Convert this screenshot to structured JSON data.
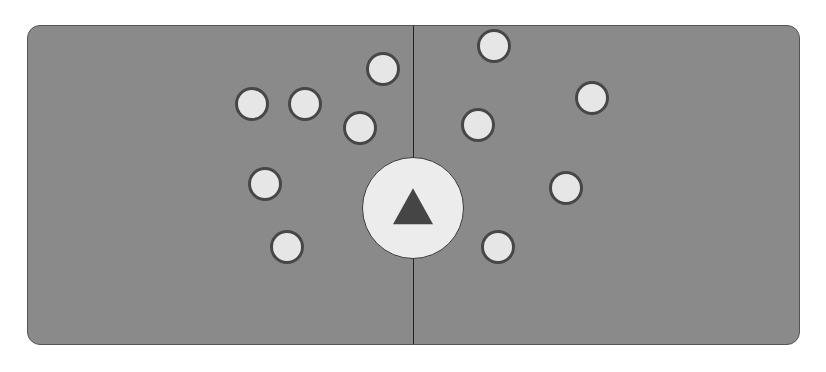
{
  "board": {
    "background_color": "#8a8a8a",
    "divider_color": "#222222",
    "left_side": {
      "dots": [
        {
          "x": 252,
          "y": 104
        },
        {
          "x": 305,
          "y": 104
        },
        {
          "x": 383,
          "y": 69
        },
        {
          "x": 360,
          "y": 128
        },
        {
          "x": 265,
          "y": 184
        },
        {
          "x": 287,
          "y": 247
        }
      ]
    },
    "right_side": {
      "dots": [
        {
          "x": 494,
          "y": 46
        },
        {
          "x": 592,
          "y": 98
        },
        {
          "x": 478,
          "y": 125
        },
        {
          "x": 566,
          "y": 188
        },
        {
          "x": 498,
          "y": 247
        }
      ]
    },
    "center_button": {
      "icon": "triangle-up-icon",
      "x": 413,
      "y": 208
    },
    "dot_fill_color": "#e6e6e6",
    "dot_border_color": "#474747"
  }
}
